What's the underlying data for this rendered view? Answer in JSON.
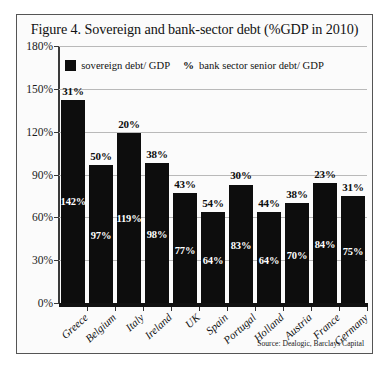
{
  "figure": {
    "title": "Figure 4. Sovereign and bank-sector debt (%GDP in 2010)",
    "source": "Source: Dealogic, Barclays Capital"
  },
  "legend": {
    "sovereign_label": "sovereign debt/ GDP",
    "pct_marker": "%",
    "bank_label": "bank sector senior debt/ GDP"
  },
  "axis": {
    "y_ticks": [
      "0%",
      "30%",
      "60%",
      "90%",
      "120%",
      "150%",
      "180%"
    ]
  },
  "chart_data": {
    "type": "bar",
    "title": "Figure 4. Sovereign and bank-sector debt (%GDP in 2010)",
    "xlabel": "",
    "ylabel": "",
    "ylim": [
      0,
      180
    ],
    "ytick_step": 30,
    "grid": true,
    "legend_position": "top-center",
    "categories": [
      "Greece",
      "Belgium",
      "Italy",
      "Ireland",
      "UK",
      "Spain",
      "Portugal",
      "Holland",
      "Austria",
      "France",
      "Germany"
    ],
    "series": [
      {
        "name": "sovereign debt/ GDP",
        "render": "bar-height-and-inner-label",
        "values": [
          142,
          97,
          119,
          98,
          77,
          64,
          83,
          64,
          70,
          84,
          75
        ],
        "labels": [
          "142%",
          "97%",
          "119%",
          "98%",
          "77%",
          "64%",
          "83%",
          "64%",
          "70%",
          "84%",
          "75%"
        ]
      },
      {
        "name": "bank sector senior debt/ GDP",
        "render": "label-above-bar",
        "values": [
          31,
          50,
          20,
          38,
          43,
          54,
          30,
          44,
          38,
          23,
          31
        ],
        "labels": [
          "31%",
          "50%",
          "20%",
          "38%",
          "43%",
          "54%",
          "30%",
          "44%",
          "38%",
          "23%",
          "31%"
        ]
      }
    ]
  }
}
